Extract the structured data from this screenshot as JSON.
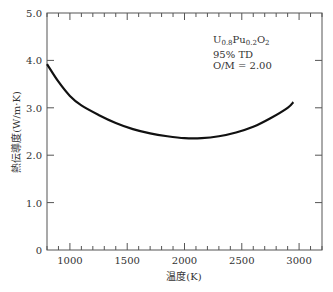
{
  "chart_data": {
    "type": "line",
    "title": "",
    "xlabel": "温度(K)",
    "ylabel": "熱伝導度(W/m·K)",
    "xlim": [
      800,
      3200
    ],
    "ylim": [
      0,
      5.0
    ],
    "x_ticks": [
      1000,
      1500,
      2000,
      2500,
      3000
    ],
    "y_ticks": [
      "0",
      "1.0",
      "2.0",
      "3.0",
      "4.0",
      "5.0"
    ],
    "grid": false,
    "series": [
      {
        "name": "U0.8Pu0.2O2",
        "x": [
          800,
          900,
          1000,
          1100,
          1250,
          1400,
          1550,
          1700,
          1850,
          2000,
          2150,
          2300,
          2450,
          2600,
          2750,
          2900,
          2950
        ],
        "y": [
          3.92,
          3.55,
          3.25,
          3.05,
          2.85,
          2.68,
          2.55,
          2.46,
          2.4,
          2.36,
          2.36,
          2.4,
          2.48,
          2.6,
          2.78,
          3.0,
          3.12
        ]
      }
    ],
    "annotations": [
      "U0.8Pu0.2O2",
      "95% TD",
      "O/M = 2.00"
    ]
  },
  "labels": {
    "annot_u": "U",
    "annot_u_sub": "0.8",
    "annot_pu": "Pu",
    "annot_pu_sub": "0.2",
    "annot_o": "O",
    "annot_o_sub": "2",
    "annot_line2": "95% TD",
    "annot_line3": "O/M = 2.00"
  }
}
